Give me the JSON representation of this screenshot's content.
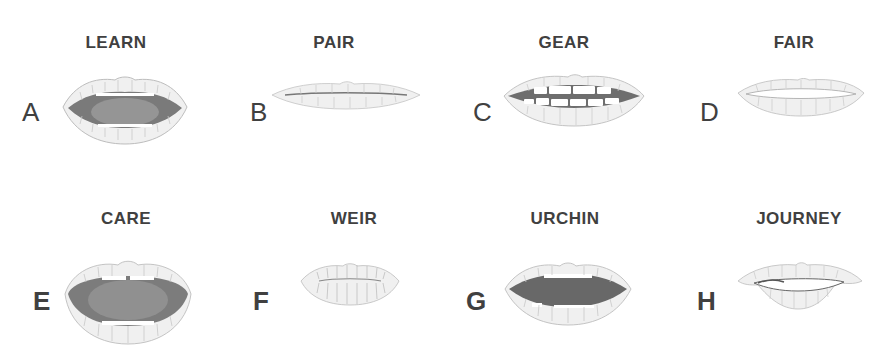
{
  "colors": {
    "text": "#404040",
    "lip_fill": "#f0f0f0",
    "lip_stroke": "#bdbdbd",
    "lip_line": "#c8c8c8",
    "mouth_dark": "#6e6e6e",
    "mouth_mid": "#8a8a8a",
    "teeth": "#ffffff"
  },
  "panels": [
    {
      "letter": "A",
      "word": "LEARN",
      "shape": "open-medium",
      "letter_bold": false
    },
    {
      "letter": "B",
      "word": "PAIR",
      "shape": "closed-flat",
      "letter_bold": false
    },
    {
      "letter": "C",
      "word": "GEAR",
      "shape": "teeth-spread",
      "letter_bold": false
    },
    {
      "letter": "D",
      "word": "FAIR",
      "shape": "slightly-open",
      "letter_bold": false
    },
    {
      "letter": "E",
      "word": "CARE",
      "shape": "open-wide",
      "letter_bold": true
    },
    {
      "letter": "F",
      "word": "WEIR",
      "shape": "rounded-small",
      "letter_bold": true
    },
    {
      "letter": "G",
      "word": "URCHIN",
      "shape": "open-oval",
      "letter_bold": true
    },
    {
      "letter": "H",
      "word": "JOURNEY",
      "shape": "pouted",
      "letter_bold": true
    }
  ]
}
